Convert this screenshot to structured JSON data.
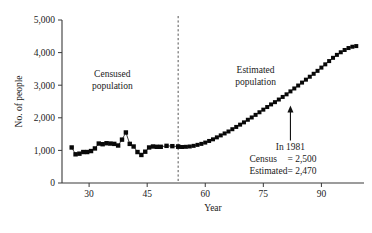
{
  "chart_data": {
    "type": "line",
    "title": "",
    "xlabel": "Year",
    "ylabel": "No. of people",
    "xlim": [
      23,
      101
    ],
    "ylim": [
      0,
      5000
    ],
    "xticks": [
      30,
      45,
      60,
      75,
      90
    ],
    "xtick_labels": [
      "30",
      "45",
      "60",
      "75",
      "90"
    ],
    "yticks": [
      0,
      1000,
      2000,
      3000,
      4000,
      5000
    ],
    "ytick_labels": [
      "0",
      "1,000",
      "2,000",
      "3,000",
      "4,000",
      "5,000"
    ],
    "grid": false,
    "legend": "none",
    "marker": "square",
    "divider_x": 53,
    "annotations": [
      {
        "name": "censused-region-label",
        "text_line1": "Censused",
        "text_line2": "population",
        "x": 36,
        "y": 3250
      },
      {
        "name": "estimated-region-label",
        "text_line1": "Estimated",
        "text_line2": "population",
        "x": 73,
        "y": 3380
      },
      {
        "name": "year-1981-callout",
        "line1": "In 1981",
        "line2_label": "Census",
        "line2_value": "= 2,500",
        "line3_label": "Estimated",
        "line3_value": "= 2,470",
        "arrow_x": 82,
        "arrow_y": 2470
      }
    ],
    "series": [
      {
        "name": "Censused population",
        "x": [
          25.5,
          26.5,
          27.5,
          28.5,
          29.5,
          30.5,
          31.5,
          32.5,
          33.5,
          34.5,
          35.5,
          36.5,
          37.5,
          38.5,
          39.5,
          40.5,
          41.5,
          42.5,
          43.5,
          44.5,
          45.5,
          46.5,
          47.5,
          48.5,
          50.0,
          51.5,
          53.0
        ],
        "values": [
          1090,
          880,
          900,
          950,
          950,
          980,
          1060,
          1210,
          1190,
          1220,
          1210,
          1200,
          1150,
          1330,
          1550,
          1200,
          1120,
          950,
          860,
          960,
          1090,
          1120,
          1110,
          1110,
          1140,
          1130,
          1120
        ]
      },
      {
        "name": "Estimated population",
        "x": [
          53,
          54,
          55,
          56,
          57,
          58,
          59,
          60,
          61,
          62,
          63,
          64,
          65,
          66,
          67,
          68,
          69,
          70,
          71,
          72,
          73,
          74,
          75,
          76,
          77,
          78,
          79,
          80,
          81,
          82,
          83,
          84,
          85,
          86,
          87,
          88,
          89,
          90,
          91,
          92,
          93,
          94,
          95,
          96,
          97,
          98,
          99
        ],
        "values": [
          1110,
          1105,
          1110,
          1120,
          1140,
          1170,
          1200,
          1240,
          1290,
          1340,
          1400,
          1460,
          1520,
          1580,
          1650,
          1720,
          1790,
          1860,
          1940,
          2010,
          2090,
          2170,
          2250,
          2330,
          2410,
          2480,
          2560,
          2640,
          2720,
          2810,
          2900,
          2990,
          3080,
          3170,
          3260,
          3350,
          3440,
          3540,
          3640,
          3740,
          3840,
          3930,
          4010,
          4080,
          4140,
          4180,
          4200
        ]
      }
    ]
  }
}
